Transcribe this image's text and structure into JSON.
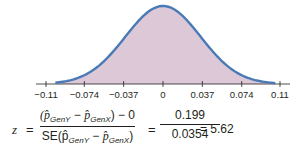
{
  "chart_data": {
    "type": "area",
    "title": "",
    "xlabel": "",
    "ylabel": "",
    "distribution": "normal",
    "mean": 0,
    "sd": 0.0354,
    "xlim": [
      -0.11,
      0.11
    ],
    "x_ticks": [
      -0.11,
      -0.074,
      -0.037,
      0,
      0.037,
      0.074,
      0.11
    ],
    "x_tick_labels": [
      "−0.11",
      "−0.074",
      "−0.037",
      "0",
      "0.037",
      "0.074",
      "0.11"
    ],
    "grid": false,
    "legend": "none",
    "colors": {
      "curve": "#4a7ab5",
      "fill": "#ddc8d8",
      "axis": "#231f20"
    }
  },
  "formula": {
    "lhs": "z",
    "equals": "=",
    "numerator_main": "(p̂",
    "sub_y": "GenY",
    "minus": " − ",
    "p_hat": "p̂",
    "sub_x": "GenX",
    "numerator_tail": ") − 0",
    "denominator_prefix": "SE(p̂",
    "denominator_tail": ")",
    "value_numerator": "0.199",
    "value_denominator": "0.0354",
    "result": "= 5.62"
  }
}
